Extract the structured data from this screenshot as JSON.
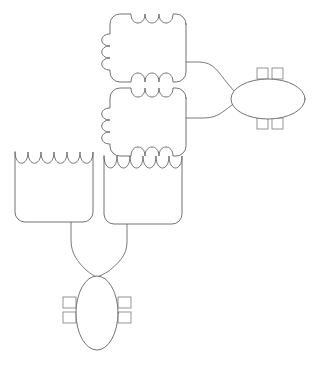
{
  "canvas": {
    "width": 322,
    "height": 367,
    "background": "#ffffff",
    "stroke_color": "#636363",
    "connector_color": "#6b6b6b"
  },
  "diagram": {
    "title": "",
    "type": "schematic-block-diagram",
    "nodes": [
      {
        "id": "cloud-top",
        "name": "bumpy-block-top",
        "label": "",
        "shape": "scalloped-block",
        "bumps": {
          "top": 3,
          "bottom": 3,
          "left": 3,
          "right": 0
        },
        "x": 106,
        "y": 14,
        "width": 80,
        "height": 68
      },
      {
        "id": "cloud-middle",
        "name": "bumpy-block-middle",
        "label": "",
        "shape": "scalloped-block",
        "bumps": {
          "top": 3,
          "bottom": 3,
          "left": 3,
          "right": 0
        },
        "x": 106,
        "y": 88,
        "width": 80,
        "height": 68
      },
      {
        "id": "box-left",
        "name": "wave-top-box-left",
        "label": "",
        "shape": "wave-top-box",
        "waves": 3,
        "x": 15,
        "y": 152,
        "width": 78,
        "height": 70
      },
      {
        "id": "box-middle",
        "name": "wave-top-box-middle",
        "label": "",
        "shape": "wave-top-box",
        "waves": 3,
        "x": 104,
        "y": 152,
        "width": 78,
        "height": 72
      },
      {
        "id": "ellipse-right",
        "name": "horizontal-terminal-ellipse",
        "label": "",
        "shape": "ellipse-horizontal",
        "cx": 268,
        "cy": 99,
        "rx": 37,
        "ry": 20,
        "tabs": {
          "top": 2,
          "bottom": 2,
          "left": 0,
          "right": 0
        }
      },
      {
        "id": "ellipse-bottom",
        "name": "vertical-terminal-ellipse",
        "label": "",
        "shape": "ellipse-vertical",
        "cx": 97,
        "cy": 313,
        "rx": 21,
        "ry": 37,
        "tabs": {
          "top": 0,
          "bottom": 0,
          "left": 2,
          "right": 2
        }
      }
    ],
    "edges": [
      {
        "id": "edge-1",
        "name": "edge-cloud-top-to-ellipse-right",
        "from": "cloud-top",
        "to": "ellipse-right",
        "style": "curved"
      },
      {
        "id": "edge-2",
        "name": "edge-cloud-middle-to-ellipse-right",
        "from": "cloud-middle",
        "to": "ellipse-right",
        "style": "curved"
      },
      {
        "id": "edge-3",
        "name": "edge-box-left-to-ellipse-bottom",
        "from": "box-left",
        "to": "ellipse-bottom",
        "style": "curved"
      },
      {
        "id": "edge-4",
        "name": "edge-box-middle-to-ellipse-bottom",
        "from": "box-middle",
        "to": "ellipse-bottom",
        "style": "curved"
      }
    ]
  },
  "caption": {
    "text": ""
  }
}
